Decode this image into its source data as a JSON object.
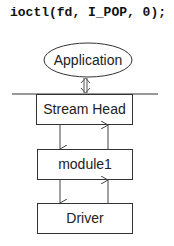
{
  "code_line": "ioctl(fd, I_POP, 0);",
  "diagram": {
    "application": "Application",
    "stream_head": "Stream Head",
    "module": "module1",
    "driver": "Driver"
  }
}
